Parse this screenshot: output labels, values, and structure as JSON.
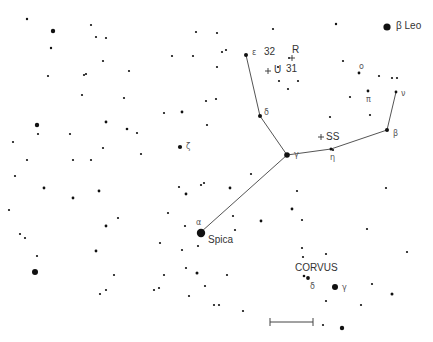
{
  "chart": {
    "constellation": "Virgo",
    "neighbor_constellation_label": "CORVUS",
    "line_color": "#555555",
    "star_color": "#111111",
    "scale_bar": {
      "x1": 270,
      "x2": 313,
      "y": 322
    }
  },
  "labels": [
    {
      "id": "beta-leo",
      "text": "β Leo",
      "x": 396,
      "y": 21,
      "cls": "name"
    },
    {
      "id": "epsilon-vir",
      "text": "ε",
      "x": 252,
      "y": 49,
      "cls": "greek"
    },
    {
      "id": "num-32",
      "text": "32",
      "x": 264,
      "y": 47,
      "cls": "num"
    },
    {
      "id": "R-var",
      "text": "R",
      "x": 292,
      "y": 45,
      "cls": "num"
    },
    {
      "id": "num-31",
      "text": "31",
      "x": 286,
      "y": 64,
      "cls": "num"
    },
    {
      "id": "U-var",
      "text": "+ U",
      "x": 266,
      "y": 65,
      "cls": "num"
    },
    {
      "id": "delta-vir",
      "text": "δ",
      "x": 264,
      "y": 109,
      "cls": "greek"
    },
    {
      "id": "zeta-vir",
      "text": "ζ",
      "x": 186,
      "y": 143,
      "cls": "greek"
    },
    {
      "id": "gamma-vir",
      "text": "γ",
      "x": 294,
      "y": 151,
      "cls": "greek"
    },
    {
      "id": "SS-var",
      "text": "+ SS",
      "x": 318,
      "y": 132,
      "cls": "num"
    },
    {
      "id": "eta-vir",
      "text": "η",
      "x": 330,
      "y": 154,
      "cls": "greek"
    },
    {
      "id": "beta-vir",
      "text": "β",
      "x": 393,
      "y": 130,
      "cls": "greek"
    },
    {
      "id": "nu-vir",
      "text": "ν",
      "x": 401,
      "y": 90,
      "cls": "greek"
    },
    {
      "id": "omicron-vir",
      "text": "ο",
      "x": 359,
      "y": 63,
      "cls": "greek"
    },
    {
      "id": "pi-vir",
      "text": "π",
      "x": 366,
      "y": 96,
      "cls": "greek"
    },
    {
      "id": "alpha-vir",
      "text": "α",
      "x": 196,
      "y": 219,
      "cls": "greek"
    },
    {
      "id": "spica",
      "text": "Spica",
      "x": 208,
      "y": 235,
      "cls": "name"
    },
    {
      "id": "corvus",
      "text": "CORVUS",
      "x": 295,
      "y": 263,
      "cls": "name"
    },
    {
      "id": "delta-crv",
      "text": "δ",
      "x": 310,
      "y": 283,
      "cls": "greek"
    },
    {
      "id": "gamma-crv",
      "text": "γ",
      "x": 342,
      "y": 284,
      "cls": "greek"
    }
  ],
  "variable_marks": [
    {
      "id": "R-cross",
      "x": 292,
      "y": 58
    },
    {
      "id": "U-cross",
      "x": 268,
      "y": 71
    },
    {
      "id": "SS-cross",
      "x": 321,
      "y": 137
    }
  ],
  "lines": [
    [
      [
        246,
        55
      ],
      [
        260,
        116
      ]
    ],
    [
      [
        260,
        116
      ],
      [
        287,
        155
      ]
    ],
    [
      [
        287,
        155
      ],
      [
        201,
        232
      ]
    ],
    [
      [
        287,
        155
      ],
      [
        331,
        149
      ]
    ],
    [
      [
        331,
        149
      ],
      [
        387,
        130
      ]
    ],
    [
      [
        387,
        130
      ],
      [
        396,
        92
      ]
    ]
  ],
  "stars": [
    {
      "x": 387,
      "y": 27,
      "r": 3.6,
      "name": "beta-leo"
    },
    {
      "x": 27,
      "y": 19,
      "r": 1.2
    },
    {
      "x": 53,
      "y": 31,
      "r": 2.2
    },
    {
      "x": 51,
      "y": 48,
      "r": 1.2
    },
    {
      "x": 91,
      "y": 25,
      "r": 1.1
    },
    {
      "x": 96,
      "y": 37,
      "r": 1.1
    },
    {
      "x": 106,
      "y": 38,
      "r": 1.1
    },
    {
      "x": 103,
      "y": 61,
      "r": 1.1
    },
    {
      "x": 129,
      "y": 71,
      "r": 1.1
    },
    {
      "x": 48,
      "y": 76,
      "r": 1.1
    },
    {
      "x": 84,
      "y": 75,
      "r": 1.1
    },
    {
      "x": 86,
      "y": 74,
      "r": 1.1
    },
    {
      "x": 82,
      "y": 95,
      "r": 1.1
    },
    {
      "x": 124,
      "y": 98,
      "r": 1.1
    },
    {
      "x": 196,
      "y": 32,
      "r": 1.1
    },
    {
      "x": 217,
      "y": 33,
      "r": 1.1
    },
    {
      "x": 273,
      "y": 29,
      "r": 1.1
    },
    {
      "x": 336,
      "y": 24,
      "r": 1.2
    },
    {
      "x": 172,
      "y": 56,
      "r": 1.1
    },
    {
      "x": 193,
      "y": 56,
      "r": 1.1
    },
    {
      "x": 222,
      "y": 52,
      "r": 1.1
    },
    {
      "x": 226,
      "y": 50,
      "r": 1.1
    },
    {
      "x": 217,
      "y": 67,
      "r": 1.1
    },
    {
      "x": 246,
      "y": 55,
      "r": 2.0,
      "name": "epsilon-vir"
    },
    {
      "x": 278,
      "y": 67,
      "r": 1.1
    },
    {
      "x": 279,
      "y": 81,
      "r": 1.1
    },
    {
      "x": 288,
      "y": 89,
      "r": 1.1
    },
    {
      "x": 298,
      "y": 81,
      "r": 1.1
    },
    {
      "x": 289,
      "y": 58,
      "r": 1.0
    },
    {
      "x": 206,
      "y": 101,
      "r": 1.1
    },
    {
      "x": 216,
      "y": 99,
      "r": 1.1
    },
    {
      "x": 164,
      "y": 113,
      "r": 1.1
    },
    {
      "x": 182,
      "y": 112,
      "r": 1.4
    },
    {
      "x": 260,
      "y": 116,
      "r": 2.0,
      "name": "delta-vir"
    },
    {
      "x": 37,
      "y": 125,
      "r": 2.2
    },
    {
      "x": 38,
      "y": 134,
      "r": 1.1
    },
    {
      "x": 13,
      "y": 142,
      "r": 1.1
    },
    {
      "x": 70,
      "y": 134,
      "r": 1.1
    },
    {
      "x": 106,
      "y": 122,
      "r": 1.4
    },
    {
      "x": 127,
      "y": 129,
      "r": 1.3
    },
    {
      "x": 137,
      "y": 133,
      "r": 1.1
    },
    {
      "x": 103,
      "y": 148,
      "r": 1.1
    },
    {
      "x": 141,
      "y": 154,
      "r": 1.1
    },
    {
      "x": 27,
      "y": 160,
      "r": 1.1
    },
    {
      "x": 73,
      "y": 160,
      "r": 1.1
    },
    {
      "x": 91,
      "y": 160,
      "r": 1.1
    },
    {
      "x": 15,
      "y": 176,
      "r": 1.1
    },
    {
      "x": 44,
      "y": 188,
      "r": 1.4
    },
    {
      "x": 73,
      "y": 198,
      "r": 1.4
    },
    {
      "x": 99,
      "y": 191,
      "r": 1.4
    },
    {
      "x": 9,
      "y": 210,
      "r": 1.1
    },
    {
      "x": 118,
      "y": 218,
      "r": 1.1
    },
    {
      "x": 106,
      "y": 226,
      "r": 1.4
    },
    {
      "x": 207,
      "y": 125,
      "r": 1.1
    },
    {
      "x": 180,
      "y": 147,
      "r": 2.1,
      "name": "zeta-vir"
    },
    {
      "x": 251,
      "y": 174,
      "r": 1.1
    },
    {
      "x": 179,
      "y": 187,
      "r": 1.1
    },
    {
      "x": 186,
      "y": 194,
      "r": 1.4
    },
    {
      "x": 201,
      "y": 185,
      "r": 1.1
    },
    {
      "x": 204,
      "y": 183,
      "r": 1.1
    },
    {
      "x": 230,
      "y": 188,
      "r": 1.4
    },
    {
      "x": 168,
      "y": 213,
      "r": 1.1
    },
    {
      "x": 233,
      "y": 216,
      "r": 1.1
    },
    {
      "x": 261,
      "y": 221,
      "r": 1.4
    },
    {
      "x": 185,
      "y": 226,
      "r": 1.1
    },
    {
      "x": 330,
      "y": 117,
      "r": 1.1
    },
    {
      "x": 370,
      "y": 115,
      "r": 1.1
    },
    {
      "x": 387,
      "y": 130,
      "r": 2.0,
      "name": "beta-vir"
    },
    {
      "x": 331,
      "y": 149,
      "r": 1.5,
      "name": "eta-vir"
    },
    {
      "x": 333,
      "y": 150,
      "r": 1.1
    },
    {
      "x": 287,
      "y": 155,
      "r": 2.8,
      "name": "gamma-vir"
    },
    {
      "x": 297,
      "y": 191,
      "r": 1.1
    },
    {
      "x": 386,
      "y": 188,
      "r": 1.1
    },
    {
      "x": 292,
      "y": 209,
      "r": 1.4
    },
    {
      "x": 302,
      "y": 220,
      "r": 1.1
    },
    {
      "x": 343,
      "y": 61,
      "r": 1.1
    },
    {
      "x": 359,
      "y": 73,
      "r": 1.4,
      "name": "omicron-vir"
    },
    {
      "x": 379,
      "y": 76,
      "r": 1.1
    },
    {
      "x": 392,
      "y": 78,
      "r": 1.1
    },
    {
      "x": 397,
      "y": 78,
      "r": 1.1
    },
    {
      "x": 368,
      "y": 91,
      "r": 1.4,
      "name": "pi-vir"
    },
    {
      "x": 350,
      "y": 97,
      "r": 1.1
    },
    {
      "x": 396,
      "y": 92,
      "r": 1.4,
      "name": "nu-vir"
    },
    {
      "x": 201,
      "y": 233,
      "r": 4.2,
      "name": "spica"
    },
    {
      "x": 235,
      "y": 230,
      "r": 1.1
    },
    {
      "x": 160,
      "y": 243,
      "r": 1.1
    },
    {
      "x": 182,
      "y": 250,
      "r": 1.1
    },
    {
      "x": 198,
      "y": 246,
      "r": 1.1
    },
    {
      "x": 186,
      "y": 268,
      "r": 1.1
    },
    {
      "x": 197,
      "y": 273,
      "r": 1.5
    },
    {
      "x": 164,
      "y": 275,
      "r": 1.1
    },
    {
      "x": 227,
      "y": 275,
      "r": 1.1
    },
    {
      "x": 154,
      "y": 290,
      "r": 1.1
    },
    {
      "x": 159,
      "y": 288,
      "r": 1.1
    },
    {
      "x": 205,
      "y": 286,
      "r": 1.1
    },
    {
      "x": 189,
      "y": 296,
      "r": 1.1
    },
    {
      "x": 214,
      "y": 305,
      "r": 1.1
    },
    {
      "x": 219,
      "y": 305,
      "r": 1.1
    },
    {
      "x": 243,
      "y": 311,
      "r": 1.1
    },
    {
      "x": 20,
      "y": 234,
      "r": 1.1
    },
    {
      "x": 25,
      "y": 238,
      "r": 1.1
    },
    {
      "x": 96,
      "y": 251,
      "r": 1.4
    },
    {
      "x": 37,
      "y": 256,
      "r": 1.1
    },
    {
      "x": 35,
      "y": 272,
      "r": 3.0
    },
    {
      "x": 114,
      "y": 275,
      "r": 1.1
    },
    {
      "x": 106,
      "y": 290,
      "r": 1.1
    },
    {
      "x": 100,
      "y": 294,
      "r": 1.1
    },
    {
      "x": 367,
      "y": 229,
      "r": 1.1
    },
    {
      "x": 302,
      "y": 248,
      "r": 1.1
    },
    {
      "x": 303,
      "y": 257,
      "r": 1.1
    },
    {
      "x": 326,
      "y": 254,
      "r": 1.1
    },
    {
      "x": 407,
      "y": 252,
      "r": 1.1
    },
    {
      "x": 304,
      "y": 276,
      "r": 1.3
    },
    {
      "x": 308,
      "y": 278,
      "r": 1.9,
      "name": "delta-crv"
    },
    {
      "x": 335,
      "y": 287,
      "r": 3.0,
      "name": "gamma-crv"
    },
    {
      "x": 372,
      "y": 284,
      "r": 1.1
    },
    {
      "x": 392,
      "y": 294,
      "r": 1.5
    },
    {
      "x": 326,
      "y": 301,
      "r": 1.1
    },
    {
      "x": 361,
      "y": 305,
      "r": 1.1
    },
    {
      "x": 323,
      "y": 325,
      "r": 1.1
    },
    {
      "x": 342,
      "y": 328,
      "r": 2.2
    }
  ]
}
